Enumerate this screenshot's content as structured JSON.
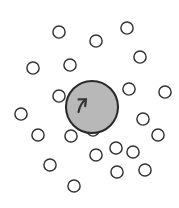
{
  "figure": {
    "width": 179,
    "height": 208,
    "background_color": "#ffffff"
  },
  "chart_data": {
    "type": "scatter",
    "subtitle": "",
    "xlabel": "",
    "ylabel": "",
    "xlim": [
      0,
      179
    ],
    "ylim": [
      0,
      208
    ],
    "grid": false,
    "legend": null,
    "axes_visible": false,
    "tick_labels_x": [],
    "tick_labels_y": [],
    "annotations": [],
    "series": [
      {
        "name": "central-particle",
        "marker": "filled-circle",
        "fill_color": "#b8b8b8",
        "stroke_color": "#2b2b2b",
        "stroke_width": 2.1,
        "radius": 26,
        "count": 1,
        "points": [
          {
            "x": 92,
            "y": 107
          }
        ],
        "marker_annotation": {
          "name": "curved-arrow-mark",
          "stroke_color": "#333333",
          "stroke_width": 2.2,
          "path": "M 86 99 C 81.5 102.5 79.5 107 78.5 112 M 86 99 L 78.6 99.4 M 86 99 L 85.2 106.2"
        }
      },
      {
        "name": "surrounding-particles",
        "marker": "open-circle",
        "fill_color": "#ffffff",
        "stroke_color": "#333333",
        "stroke_width": 1.45,
        "radius": 6.1,
        "count": 22,
        "points": [
          {
            "x": 59,
            "y": 32
          },
          {
            "x": 96,
            "y": 41
          },
          {
            "x": 127,
            "y": 28
          },
          {
            "x": 140,
            "y": 57
          },
          {
            "x": 70,
            "y": 65
          },
          {
            "x": 33,
            "y": 68
          },
          {
            "x": 129,
            "y": 89
          },
          {
            "x": 165,
            "y": 92
          },
          {
            "x": 59,
            "y": 96
          },
          {
            "x": 21,
            "y": 114
          },
          {
            "x": 143,
            "y": 119
          },
          {
            "x": 38,
            "y": 135
          },
          {
            "x": 71,
            "y": 136
          },
          {
            "x": 158,
            "y": 135
          },
          {
            "x": 133,
            "y": 152
          },
          {
            "x": 96,
            "y": 155
          },
          {
            "x": 50,
            "y": 165
          },
          {
            "x": 145,
            "y": 170
          },
          {
            "x": 117,
            "y": 172
          },
          {
            "x": 74,
            "y": 186
          },
          {
            "x": 116,
            "y": 148
          },
          {
            "x": 93,
            "y": 130
          }
        ]
      }
    ]
  }
}
